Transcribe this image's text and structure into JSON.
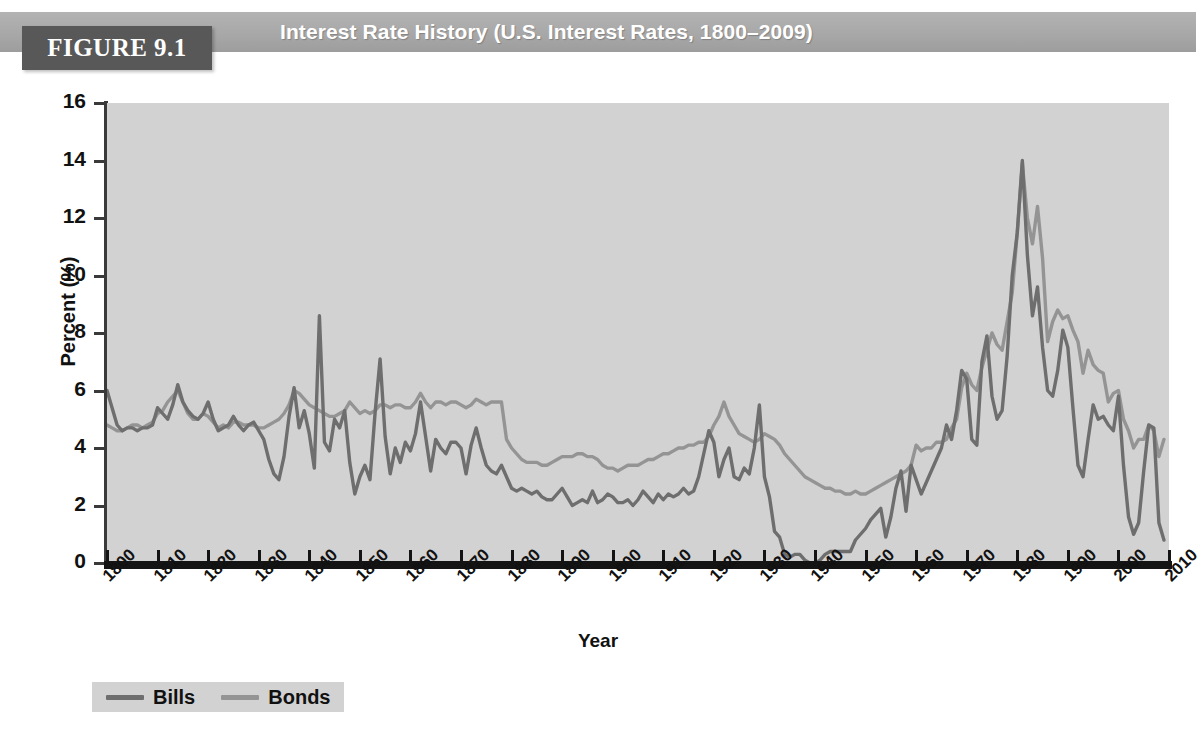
{
  "figure": {
    "number_label": "FIGURE 9.1",
    "title": "Interest Rate History (U.S. Interest Rates, 1800–2009)"
  },
  "axes": {
    "y_title": "Percent (%)",
    "x_title": "Year",
    "y_ticks": [
      "0",
      "2",
      "4",
      "6",
      "8",
      "10",
      "12",
      "14",
      "16"
    ],
    "x_ticks": [
      "1800",
      "1810",
      "1820",
      "1830",
      "1840",
      "1850",
      "1860",
      "1870",
      "1880",
      "1890",
      "1900",
      "1910",
      "1920",
      "1930",
      "1940",
      "1950",
      "1960",
      "1970",
      "1980",
      "1990",
      "2000",
      "2010"
    ]
  },
  "legend": {
    "items": [
      {
        "label": "Bills",
        "color": "#6e6e6e"
      },
      {
        "label": "Bonds",
        "color": "#949494"
      }
    ]
  },
  "colors": {
    "plot_background": "#d2d2d2",
    "header_band": "#a8a8a8",
    "figure_box": "#585858",
    "axis": "#141414",
    "bills": "#6e6e6e",
    "bonds": "#949494"
  },
  "chart_data": {
    "type": "line",
    "title": "Interest Rate History (U.S. Interest Rates, 1800–2009)",
    "xlabel": "Year",
    "ylabel": "Percent (%)",
    "xlim": [
      1800,
      2010
    ],
    "ylim": [
      0,
      16
    ],
    "grid": false,
    "legend_position": "below-left",
    "x_tick_step": 10,
    "y_tick_step": 2,
    "series": [
      {
        "name": "Bills",
        "color": "#6e6e6e",
        "x_start": 1800,
        "x_step": 1,
        "values": [
          6.0,
          5.4,
          4.8,
          4.6,
          4.7,
          4.7,
          4.6,
          4.7,
          4.7,
          4.8,
          5.4,
          5.2,
          5.0,
          5.5,
          6.2,
          5.6,
          5.3,
          5.1,
          5.0,
          5.2,
          5.6,
          5.0,
          4.6,
          4.7,
          4.8,
          5.1,
          4.8,
          4.6,
          4.8,
          4.9,
          4.6,
          4.3,
          3.6,
          3.1,
          2.9,
          3.7,
          5.1,
          6.1,
          4.7,
          5.3,
          4.5,
          3.3,
          8.6,
          4.2,
          3.9,
          5.0,
          4.7,
          5.3,
          3.5,
          2.4,
          3.0,
          3.4,
          2.9,
          5.2,
          7.1,
          4.4,
          3.1,
          4.0,
          3.5,
          4.2,
          3.9,
          4.5,
          5.6,
          4.4,
          3.2,
          4.3,
          4.0,
          3.8,
          4.2,
          4.2,
          4.0,
          3.1,
          4.1,
          4.7,
          4.0,
          3.4,
          3.2,
          3.1,
          3.4,
          3.0,
          2.6,
          2.5,
          2.6,
          2.5,
          2.4,
          2.5,
          2.3,
          2.2,
          2.2,
          2.4,
          2.6,
          2.3,
          2.0,
          2.1,
          2.2,
          2.1,
          2.5,
          2.1,
          2.2,
          2.4,
          2.3,
          2.1,
          2.1,
          2.2,
          2.0,
          2.2,
          2.5,
          2.3,
          2.1,
          2.4,
          2.2,
          2.4,
          2.3,
          2.4,
          2.6,
          2.4,
          2.5,
          3.0,
          3.8,
          4.6,
          4.2,
          3.0,
          3.6,
          4.0,
          3.0,
          2.9,
          3.3,
          3.1,
          4.0,
          5.5,
          3.0,
          2.3,
          1.1,
          0.9,
          0.3,
          0.2,
          0.3,
          0.3,
          0.1,
          0.0,
          0.0,
          0.1,
          0.3,
          0.4,
          0.4,
          0.4,
          0.4,
          0.4,
          0.8,
          1.0,
          1.2,
          1.5,
          1.7,
          1.9,
          0.9,
          1.6,
          2.6,
          3.2,
          1.8,
          3.4,
          2.9,
          2.4,
          2.8,
          3.2,
          3.6,
          4.0,
          4.8,
          4.3,
          5.3,
          6.7,
          6.4,
          4.3,
          4.1,
          7.0,
          7.9,
          5.8,
          5.0,
          5.3,
          7.2,
          10.0,
          11.5,
          14.0,
          10.7,
          8.6,
          9.6,
          7.5,
          6.0,
          5.8,
          6.7,
          8.1,
          7.5,
          5.4,
          3.4,
          3.0,
          4.3,
          5.5,
          5.0,
          5.1,
          4.8,
          4.6,
          5.8,
          3.4,
          1.6,
          1.0,
          1.4,
          3.2,
          4.8,
          4.7,
          1.4,
          0.8
        ]
      },
      {
        "name": "Bonds",
        "color": "#949494",
        "x_start": 1800,
        "x_step": 1,
        "values": [
          4.8,
          4.7,
          4.6,
          4.6,
          4.7,
          4.8,
          4.8,
          4.7,
          4.8,
          4.9,
          5.2,
          5.3,
          5.6,
          5.8,
          6.0,
          5.6,
          5.2,
          5.0,
          5.0,
          5.2,
          5.1,
          4.9,
          4.7,
          4.8,
          4.7,
          4.9,
          4.9,
          4.8,
          4.8,
          4.8,
          4.7,
          4.7,
          4.8,
          4.9,
          5.0,
          5.2,
          5.5,
          6.0,
          5.9,
          5.7,
          5.5,
          5.4,
          5.3,
          5.2,
          5.1,
          5.1,
          5.2,
          5.3,
          5.6,
          5.4,
          5.2,
          5.3,
          5.2,
          5.3,
          5.5,
          5.5,
          5.4,
          5.5,
          5.5,
          5.4,
          5.4,
          5.6,
          5.9,
          5.6,
          5.4,
          5.6,
          5.6,
          5.5,
          5.6,
          5.6,
          5.5,
          5.4,
          5.5,
          5.7,
          5.6,
          5.5,
          5.6,
          5.6,
          5.6,
          4.3,
          4.0,
          3.8,
          3.6,
          3.5,
          3.5,
          3.5,
          3.4,
          3.4,
          3.5,
          3.6,
          3.7,
          3.7,
          3.7,
          3.8,
          3.8,
          3.7,
          3.7,
          3.6,
          3.4,
          3.3,
          3.3,
          3.2,
          3.3,
          3.4,
          3.4,
          3.4,
          3.5,
          3.6,
          3.6,
          3.7,
          3.8,
          3.8,
          3.9,
          4.0,
          4.0,
          4.1,
          4.1,
          4.2,
          4.2,
          4.4,
          4.8,
          5.1,
          5.6,
          5.1,
          4.8,
          4.5,
          4.4,
          4.3,
          4.2,
          4.3,
          4.5,
          4.4,
          4.3,
          4.1,
          3.8,
          3.6,
          3.4,
          3.2,
          3.0,
          2.9,
          2.8,
          2.7,
          2.6,
          2.6,
          2.5,
          2.5,
          2.4,
          2.4,
          2.5,
          2.4,
          2.4,
          2.5,
          2.6,
          2.7,
          2.8,
          2.9,
          3.0,
          3.1,
          3.2,
          3.4,
          4.1,
          3.9,
          4.0,
          4.0,
          4.2,
          4.2,
          4.3,
          4.7,
          5.0,
          6.1,
          6.6,
          6.2,
          6.0,
          6.8,
          7.4,
          8.0,
          7.6,
          7.4,
          8.4,
          9.4,
          11.5,
          13.9,
          12.0,
          11.1,
          12.4,
          10.6,
          7.7,
          8.4,
          8.8,
          8.5,
          8.6,
          8.1,
          7.7,
          6.6,
          7.4,
          6.9,
          6.7,
          6.6,
          5.6,
          5.9,
          6.0,
          5.0,
          4.6,
          4.0,
          4.3,
          4.3,
          4.8,
          4.6,
          3.7,
          4.3
        ]
      }
    ]
  }
}
